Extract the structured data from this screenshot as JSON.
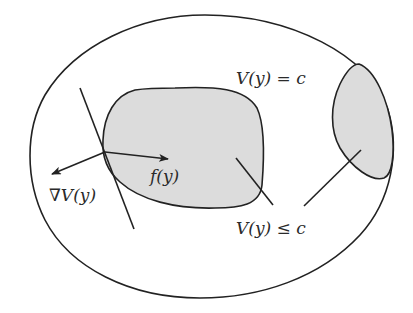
{
  "diagram": {
    "colors": {
      "stroke": "#222222",
      "fill_region": "#dcdcdc",
      "background": "#ffffff"
    },
    "labels": {
      "level_set": "V(y) = c",
      "gradient": "∇V(y)",
      "vector_field": "f(y)",
      "sublevel_set": "V(y) ≤ c"
    },
    "elements": [
      {
        "name": "outer-domain",
        "shape": "closed-curve",
        "filled": false
      },
      {
        "name": "sublevel-region-main",
        "shape": "closed-curve",
        "filled": true
      },
      {
        "name": "sublevel-region-right",
        "shape": "closed-curve",
        "filled": true
      },
      {
        "name": "tangent-line",
        "shape": "line"
      },
      {
        "name": "gradient-arrow",
        "shape": "arrow",
        "label": "∇V(y)"
      },
      {
        "name": "vector-field-arrow",
        "shape": "arrow",
        "label": "f(y)"
      },
      {
        "name": "pointer-line-main",
        "shape": "line",
        "points_to": "sublevel-region-main"
      },
      {
        "name": "pointer-line-right",
        "shape": "line",
        "points_to": "sublevel-region-right"
      }
    ]
  }
}
